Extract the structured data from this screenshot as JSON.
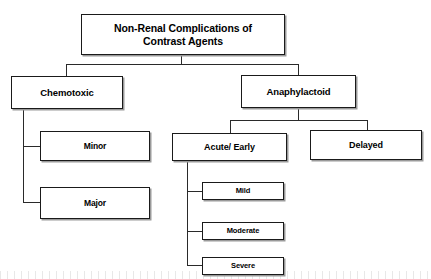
{
  "diagram": {
    "title": "Non-Renal Complications of Contrast Agents",
    "type": "flowchart",
    "orientation": "top-down",
    "style": {
      "background": "#ffffff",
      "box_fill": "#ffffff",
      "box_border": "#1a1a1a",
      "box_shadow": "#9a9a9a",
      "connector_color": "#2a2a2a",
      "text_color": "#000000"
    },
    "nodes": {
      "root": {
        "id": "root",
        "label": "Non-Renal Complications of\nContrast Agents",
        "level": 0
      },
      "chemotoxic": {
        "id": "chemotoxic",
        "label": "Chemotoxic",
        "level": 1
      },
      "anaphylactoid": {
        "id": "anaphylactoid",
        "label": "Anaphylactoid",
        "level": 1
      },
      "minor": {
        "id": "minor",
        "label": "Minor",
        "level": 2
      },
      "major": {
        "id": "major",
        "label": "Major",
        "level": 2
      },
      "acute_early": {
        "id": "acute_early",
        "label": "Acute/ Early",
        "level": 2
      },
      "delayed": {
        "id": "delayed",
        "label": "Delayed",
        "level": 2
      },
      "mild": {
        "id": "mild",
        "label": "Mild",
        "level": 3
      },
      "moderate": {
        "id": "moderate",
        "label": "Moderate",
        "level": 3
      },
      "severe": {
        "id": "severe",
        "label": "Severe",
        "level": 3
      }
    },
    "edges": [
      {
        "from": "root",
        "to": "chemotoxic"
      },
      {
        "from": "root",
        "to": "anaphylactoid"
      },
      {
        "from": "chemotoxic",
        "to": "minor"
      },
      {
        "from": "chemotoxic",
        "to": "major"
      },
      {
        "from": "anaphylactoid",
        "to": "acute_early"
      },
      {
        "from": "anaphylactoid",
        "to": "delayed"
      },
      {
        "from": "acute_early",
        "to": "mild"
      },
      {
        "from": "acute_early",
        "to": "moderate"
      },
      {
        "from": "acute_early",
        "to": "severe"
      }
    ]
  }
}
